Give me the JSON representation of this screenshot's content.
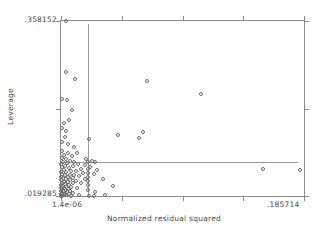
{
  "chart_data": {
    "type": "scatter",
    "title": "",
    "xlabel": "Normalized residual squared",
    "ylabel": "Leverage",
    "xlim": [
      1.4e-06,
      0.185714
    ],
    "ylim": [
      0.019285,
      0.358152
    ],
    "x_ticklabels": [
      "1.4e-06",
      ".185714"
    ],
    "y_ticklabels": [
      ".019285",
      ".358152"
    ],
    "grid": false,
    "legend": false,
    "marker": "open-circle",
    "reference_lines": [
      {
        "orientation": "vertical",
        "x": 0.0205,
        "label": ""
      },
      {
        "orientation": "horizontal",
        "y": 0.0855,
        "label": ""
      }
    ],
    "points": [
      {
        "x": 0.0035,
        "y": 0.3582
      },
      {
        "x": 0.0035,
        "y": 0.2603
      },
      {
        "x": 0.0105,
        "y": 0.2452
      },
      {
        "x": 0.066,
        "y": 0.2418
      },
      {
        "x": 0.107,
        "y": 0.2164
      },
      {
        "x": 0.001,
        "y": 0.2067
      },
      {
        "x": 0.0045,
        "y": 0.2061
      },
      {
        "x": 0.0085,
        "y": 0.186
      },
      {
        "x": 0.006,
        "y": 0.166
      },
      {
        "x": 0.002,
        "y": 0.16
      },
      {
        "x": 0.001,
        "y": 0.151
      },
      {
        "x": 0.004,
        "y": 0.145
      },
      {
        "x": 0.0625,
        "y": 0.143
      },
      {
        "x": 0.0435,
        "y": 0.138
      },
      {
        "x": 0.003,
        "y": 0.133
      },
      {
        "x": 0.0595,
        "y": 0.131
      },
      {
        "x": 0.0215,
        "y": 0.13
      },
      {
        "x": 0.001,
        "y": 0.123
      },
      {
        "x": 0.005,
        "y": 0.12
      },
      {
        "x": 0.01,
        "y": 0.115
      },
      {
        "x": 0.0005,
        "y": 0.106
      },
      {
        "x": 0.0055,
        "y": 0.1035
      },
      {
        "x": 0.0125,
        "y": 0.102
      },
      {
        "x": 0.002,
        "y": 0.0985
      },
      {
        "x": 0.0085,
        "y": 0.096
      },
      {
        "x": 0.0005,
        "y": 0.0935
      },
      {
        "x": 0.0035,
        "y": 0.091
      },
      {
        "x": 0.019,
        "y": 0.0905
      },
      {
        "x": 0.007,
        "y": 0.088
      },
      {
        "x": 0.0235,
        "y": 0.087
      },
      {
        "x": 0.0015,
        "y": 0.086
      },
      {
        "x": 0.01,
        "y": 0.0855
      },
      {
        "x": 0.0205,
        "y": 0.085
      },
      {
        "x": 0.026,
        "y": 0.0845
      },
      {
        "x": 0.0045,
        "y": 0.083
      },
      {
        "x": 0.0,
        "y": 0.082
      },
      {
        "x": 0.013,
        "y": 0.081
      },
      {
        "x": 0.018,
        "y": 0.0795
      },
      {
        "x": 0.003,
        "y": 0.0775
      },
      {
        "x": 0.009,
        "y": 0.077
      },
      {
        "x": 0.0225,
        "y": 0.076
      },
      {
        "x": 0.0005,
        "y": 0.0745
      },
      {
        "x": 0.006,
        "y": 0.0735
      },
      {
        "x": 0.015,
        "y": 0.0725
      },
      {
        "x": 0.154,
        "y": 0.072
      },
      {
        "x": 0.0205,
        "y": 0.071
      },
      {
        "x": 0.002,
        "y": 0.07
      },
      {
        "x": 0.0275,
        "y": 0.0695
      },
      {
        "x": 0.183,
        "y": 0.069
      },
      {
        "x": 0.008,
        "y": 0.068
      },
      {
        "x": 0.0115,
        "y": 0.067
      },
      {
        "x": 0.0,
        "y": 0.066
      },
      {
        "x": 0.004,
        "y": 0.065
      },
      {
        "x": 0.0165,
        "y": 0.0645
      },
      {
        "x": 0.0205,
        "y": 0.0635
      },
      {
        "x": 0.025,
        "y": 0.0625
      },
      {
        "x": 0.001,
        "y": 0.0615
      },
      {
        "x": 0.0065,
        "y": 0.0605
      },
      {
        "x": 0.01,
        "y": 0.06
      },
      {
        "x": 0.003,
        "y": 0.059
      },
      {
        "x": 0.014,
        "y": 0.058
      },
      {
        "x": 0.0205,
        "y": 0.057
      },
      {
        "x": 0.0,
        "y": 0.056
      },
      {
        "x": 0.005,
        "y": 0.0555
      },
      {
        "x": 0.009,
        "y": 0.0545
      },
      {
        "x": 0.0015,
        "y": 0.0535
      },
      {
        "x": 0.0185,
        "y": 0.053
      },
      {
        "x": 0.032,
        "y": 0.0525
      },
      {
        "x": 0.0035,
        "y": 0.0515
      },
      {
        "x": 0.007,
        "y": 0.0505
      },
      {
        "x": 0.0,
        "y": 0.0495
      },
      {
        "x": 0.0115,
        "y": 0.049
      },
      {
        "x": 0.0205,
        "y": 0.048
      },
      {
        "x": 0.0025,
        "y": 0.047
      },
      {
        "x": 0.0055,
        "y": 0.046
      },
      {
        "x": 0.0005,
        "y": 0.045
      },
      {
        "x": 0.015,
        "y": 0.0445
      },
      {
        "x": 0.009,
        "y": 0.0435
      },
      {
        "x": 0.003,
        "y": 0.0425
      },
      {
        "x": 0.0,
        "y": 0.0415
      },
      {
        "x": 0.006,
        "y": 0.0405
      },
      {
        "x": 0.0205,
        "y": 0.04
      },
      {
        "x": 0.0015,
        "y": 0.039
      },
      {
        "x": 0.04,
        "y": 0.0385
      },
      {
        "x": 0.004,
        "y": 0.0375
      },
      {
        "x": 0.008,
        "y": 0.0365
      },
      {
        "x": 0.0,
        "y": 0.0355
      },
      {
        "x": 0.012,
        "y": 0.035
      },
      {
        "x": 0.0025,
        "y": 0.034
      },
      {
        "x": 0.0055,
        "y": 0.033
      },
      {
        "x": 0.001,
        "y": 0.032
      },
      {
        "x": 0.0205,
        "y": 0.0315
      },
      {
        "x": 0.0035,
        "y": 0.0305
      },
      {
        "x": 0.0,
        "y": 0.0295
      },
      {
        "x": 0.007,
        "y": 0.029
      },
      {
        "x": 0.0015,
        "y": 0.028
      },
      {
        "x": 0.0045,
        "y": 0.027
      },
      {
        "x": 0.026,
        "y": 0.0265
      },
      {
        "x": 0.0005,
        "y": 0.0255
      },
      {
        "x": 0.0095,
        "y": 0.025
      },
      {
        "x": 0.003,
        "y": 0.024
      },
      {
        "x": 0.0,
        "y": 0.0232
      },
      {
        "x": 0.006,
        "y": 0.0228
      },
      {
        "x": 0.002,
        "y": 0.0222
      },
      {
        "x": 0.014,
        "y": 0.0215
      },
      {
        "x": 0.034,
        "y": 0.0212
      },
      {
        "x": 0.004,
        "y": 0.0208
      },
      {
        "x": 0.001,
        "y": 0.0202
      },
      {
        "x": 0.0215,
        "y": 0.0198
      },
      {
        "x": 0.025,
        "y": 0.0196
      },
      {
        "x": 0.008,
        "y": 0.0194
      },
      {
        "x": 0.0,
        "y": 0.0193
      }
    ]
  }
}
